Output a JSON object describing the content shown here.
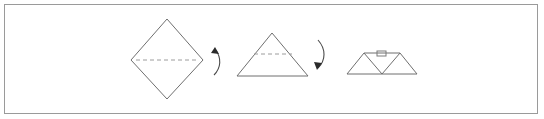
{
  "diagram": {
    "title": "Paper folding instruction sequence",
    "background_color": "#ffffff",
    "frame": {
      "name": "outer-frame",
      "border_color": "#9a9a9a",
      "x": 4,
      "y": 4,
      "width": 534,
      "height": 110
    },
    "line_color": "#6f6f6f",
    "fold_line_color": "#9c9c9c",
    "arrow_color": "#2b2b2b",
    "steps": [
      {
        "index": 1,
        "name": "diamond-with-horizontal-fold",
        "shape": "diamond",
        "label": "Square rotated 45 degrees with horizontal dashed fold line through the middle",
        "points": [
          [
            167,
            19
          ],
          [
            203,
            60
          ],
          [
            167,
            99
          ],
          [
            131,
            60
          ]
        ],
        "fold_line": [
          [
            136,
            60
          ],
          [
            198,
            60
          ]
        ],
        "fold_style": "dashed"
      },
      {
        "index": 2,
        "name": "triangle-with-horizontal-fold",
        "shape": "triangle",
        "label": "Triangle with a horizontal dashed fold line across the upper portion",
        "points": [
          [
            272,
            33
          ],
          [
            308,
            76
          ],
          [
            237,
            76
          ]
        ],
        "fold_line": [
          [
            254,
            54
          ],
          [
            292,
            54
          ]
        ],
        "fold_style": "dashed"
      },
      {
        "index": 3,
        "name": "double-triangle-with-tab",
        "shape": "double-triangle",
        "label": "Two adjoining triangles forming a W shape with a small folded tab at the top center",
        "points": [
          [
            347,
            74
          ],
          [
            364,
            53
          ],
          [
            382,
            74
          ],
          [
            400,
            53
          ],
          [
            417,
            74
          ]
        ],
        "ridge_line": [
          [
            364,
            53
          ],
          [
            400,
            53
          ]
        ],
        "tab": {
          "name": "fold-tab",
          "x": 377,
          "y": 51,
          "width": 9,
          "height": 5
        }
      }
    ],
    "arrows": [
      {
        "index": 1,
        "name": "fold-arrow-one",
        "direction": "curved-down-then-up",
        "head_position": "top",
        "path": "M 214 75 C 221 68, 222 58, 215 49",
        "head": [
          [
            215,
            47
          ],
          [
            219,
            54
          ],
          [
            211,
            53
          ]
        ]
      },
      {
        "index": 2,
        "name": "fold-arrow-two",
        "direction": "curved-down",
        "head_position": "bottom",
        "path": "M 318 40 C 326 49, 326 60, 318 68",
        "head": [
          [
            317,
            70
          ],
          [
            314,
            62
          ],
          [
            322,
            63
          ]
        ]
      }
    ]
  }
}
